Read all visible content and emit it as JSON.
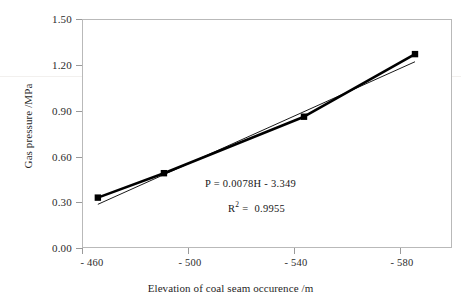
{
  "chart_data": {
    "type": "scatter",
    "title": "",
    "subtitle": "",
    "xlabel": "Elevation of coal seam occurence /m",
    "ylabel": "Gas pressure /MPa",
    "xlim": [
      -460,
      -600
    ],
    "ylim": [
      0.0,
      1.5
    ],
    "x_ticks": [
      -460,
      -500,
      -540,
      -580
    ],
    "x_tick_labels": [
      "- 460",
      "- 500",
      "- 540",
      "- 580"
    ],
    "y_ticks": [
      0.0,
      0.3,
      0.6,
      0.9,
      1.2,
      1.5
    ],
    "y_tick_labels": [
      "0.00",
      "0.30",
      "0.60",
      "0.90",
      "1.20",
      "1.50"
    ],
    "grid": false,
    "legend": false,
    "legend_position": "none",
    "marker": "filled-square",
    "marker_color": "#000000",
    "line_color": "#000000",
    "series": [
      {
        "name": "measured",
        "x": [
          -466,
          -491,
          -544,
          -586
        ],
        "y": [
          0.33,
          0.49,
          0.86,
          1.27
        ]
      },
      {
        "name": "linear-fit",
        "x": [
          -466,
          -586
        ],
        "y": [
          0.286,
          1.22
        ]
      }
    ],
    "annotations": [
      {
        "id": "equation",
        "text": "P = 0.0078H - 3.349",
        "x": -510,
        "y": 0.455
      },
      {
        "id": "r-squared",
        "text": "R 2  =  0.9955",
        "x": -518,
        "y": 0.31
      }
    ]
  },
  "axis": {
    "y_title": "Gas pressure /MPa",
    "x_title": "Elevation of coal seam occurence /m"
  },
  "annotations": {
    "equation": "P = 0.0078H - 3.349",
    "r_label": "R",
    "r_exponent": "2",
    "r_equals": "=",
    "r_value": "0.9955"
  },
  "colors": {
    "line": "#000000",
    "marker": "#000000",
    "frame": "#b9b9b9",
    "tick": "#9a9a9a",
    "text": "#1f1f1f",
    "background": "#ffffff"
  }
}
